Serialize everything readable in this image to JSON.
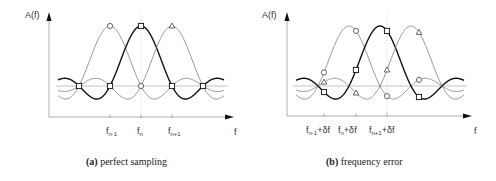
{
  "panels": [
    {
      "id": "a",
      "y_axis_label": "A(f)",
      "x_axis_label": "f",
      "ticks": [
        {
          "base": "f",
          "sub": "n-1",
          "suffix": ""
        },
        {
          "base": "f",
          "sub": "n",
          "suffix": ""
        },
        {
          "base": "f",
          "sub": "n+1",
          "suffix": ""
        }
      ],
      "caption_prefix": "(a)",
      "caption_text": " perfect sampling",
      "markers": [
        "circle",
        "square",
        "triangle"
      ]
    },
    {
      "id": "b",
      "y_axis_label": "A(f)",
      "x_axis_label": "f",
      "ticks": [
        {
          "base": "f",
          "sub": "n-1",
          "suffix": "+δf"
        },
        {
          "base": "f",
          "sub": "n",
          "suffix": "+δf"
        },
        {
          "base": "f",
          "sub": "n+1",
          "suffix": "+δf"
        }
      ],
      "caption_prefix": "(b)",
      "caption_text": " frequency error",
      "markers": [
        "circle",
        "square",
        "triangle"
      ]
    }
  ],
  "colors": {
    "axis": "#888888",
    "curve_light": "#777777",
    "curve_dark": "#111111",
    "baseline": "#aaaaaa"
  }
}
